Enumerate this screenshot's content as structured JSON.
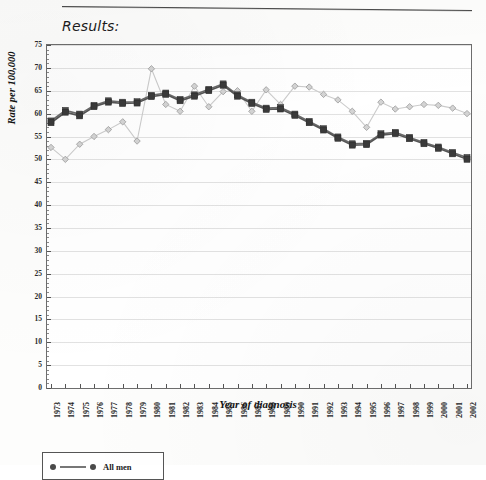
{
  "document": {
    "section_label": "Results:"
  },
  "chart_data": {
    "type": "line",
    "title": "",
    "xlabel": "Year of diagnosis",
    "ylabel": "Rate per 100,000",
    "ylim": [
      0,
      75
    ],
    "ytick_step": 5,
    "yticks": [
      0,
      5,
      10,
      15,
      20,
      25,
      30,
      35,
      40,
      45,
      50,
      55,
      60,
      65,
      70,
      75
    ],
    "grid": true,
    "grid_axis": "y",
    "legend_position": "below-axes-left",
    "categories": [
      "1973",
      "1974",
      "1975",
      "1976",
      "1977",
      "1978",
      "1979",
      "1980",
      "1981",
      "1982",
      "1983",
      "1984",
      "1985",
      "1986",
      "1987",
      "1988",
      "1989",
      "1990",
      "1991",
      "1992",
      "1993",
      "1994",
      "1995",
      "1996",
      "1997",
      "1998",
      "1999",
      "2000",
      "2001",
      "2002"
    ],
    "series": [
      {
        "name": "All men",
        "marker": "square",
        "color": "#3a3a3a",
        "line_color": "#555555",
        "values": [
          58.0,
          60.3,
          59.5,
          61.5,
          62.5,
          62.2,
          62.3,
          63.7,
          64.2,
          62.8,
          63.8,
          65.0,
          66.2,
          63.8,
          62.2,
          60.9,
          61.0,
          59.6,
          58.0,
          56.4,
          54.6,
          53.1,
          53.2,
          55.3,
          55.6,
          54.5,
          53.4,
          52.4,
          51.2,
          50.0
        ]
      },
      {
        "name": "All men (second estimate)",
        "marker": "square",
        "color": "#4a4a4a",
        "line_color": "#6a6a6a",
        "values": [
          58.4,
          60.7,
          59.9,
          61.8,
          62.8,
          62.5,
          62.6,
          64.0,
          64.5,
          63.1,
          64.1,
          65.3,
          66.5,
          64.1,
          62.5,
          61.2,
          61.3,
          59.9,
          58.3,
          56.7,
          54.9,
          53.4,
          53.5,
          55.6,
          55.9,
          54.8,
          53.7,
          52.7,
          51.5,
          50.4
        ]
      },
      {
        "name": "Comparison group",
        "marker": "diamond",
        "color": "#b9b9b9",
        "line_color": "#cccccc",
        "values": [
          52.6,
          50.0,
          53.3,
          55.0,
          56.5,
          58.2,
          54.0,
          69.8,
          62.0,
          60.5,
          66.0,
          61.5,
          64.8,
          65.0,
          60.5,
          65.2,
          62.0,
          66.0,
          65.8,
          64.2,
          63.0,
          60.5,
          57.0,
          62.5,
          61.0,
          61.5,
          62.0,
          61.8,
          61.2,
          60.0
        ]
      }
    ]
  },
  "legend": {
    "entries": [
      {
        "label": "All men",
        "marker": "circle",
        "color": "#4a4a4a"
      }
    ]
  }
}
